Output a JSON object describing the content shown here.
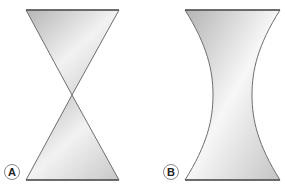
{
  "figure": {
    "panels": [
      {
        "id": "A",
        "label": "A",
        "shape": "double-cone (hourglass with apex)"
      },
      {
        "id": "B",
        "label": "B",
        "shape": "hyperboloid of one sheet"
      }
    ],
    "colors": {
      "fill_light": "#f4f4f4",
      "fill_dark": "#b9b9b9",
      "stroke": "#6e6e6e",
      "label_circle": "#888888"
    }
  }
}
